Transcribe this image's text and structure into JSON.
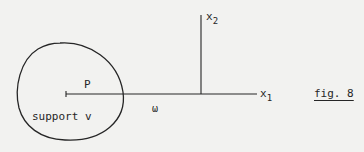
{
  "figure": {
    "caption": "fig. 8",
    "region_label": "support v",
    "point_label": "P",
    "omega_label": "ω",
    "axes": {
      "x1": {
        "base": "x",
        "sub": "1"
      },
      "x2": {
        "base": "x",
        "sub": "2"
      }
    }
  },
  "colors": {
    "background": "#f2f2f0",
    "ink": "#262626"
  }
}
